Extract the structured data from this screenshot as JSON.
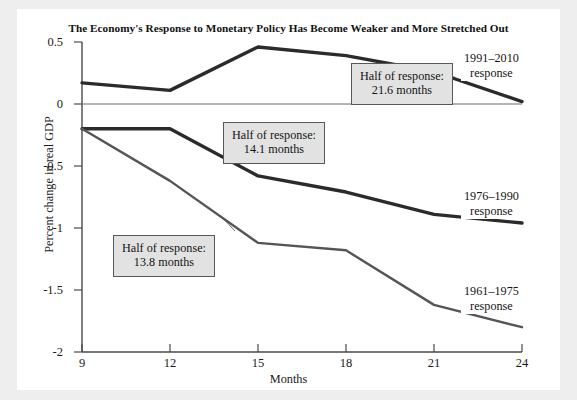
{
  "chart_data": {
    "type": "line",
    "title": "The Economy's Response to Monetary Policy Has Become Weaker and More Stretched Out",
    "xlabel": "Months",
    "ylabel": "Percent change in real GDP",
    "x": [
      9,
      12,
      15,
      18,
      21,
      24
    ],
    "xlim": [
      9,
      24
    ],
    "ylim": [
      -2,
      0.5
    ],
    "xticks": [
      "9",
      "12",
      "15",
      "18",
      "21",
      "24"
    ],
    "yticks": [
      "0.5",
      "0",
      "-0.5",
      "-1",
      "-1.5",
      "-2"
    ],
    "ytick_values": [
      0.5,
      0,
      -0.5,
      -1,
      -1.5,
      -2
    ],
    "grid": false,
    "zero_line": true,
    "legend": "inline-right-labels",
    "series": [
      {
        "name": "1991-2010 response",
        "label_line1": "1991–2010",
        "label_line2": "response",
        "values": [
          0.17,
          0.11,
          0.46,
          0.39,
          0.26,
          0.02
        ],
        "color": "#2b2b2b",
        "width": 3.4
      },
      {
        "name": "1976-1990 response",
        "label_line1": "1976–1990",
        "label_line2": "response",
        "values": [
          -0.2,
          -0.2,
          -0.58,
          -0.71,
          -0.89,
          -0.96
        ],
        "color": "#2b2b2b",
        "width": 3.4
      },
      {
        "name": "1961-1975 response",
        "label_line1": "1961–1975",
        "label_line2": "response",
        "values": [
          -0.2,
          -0.62,
          -1.12,
          -1.18,
          -1.62,
          -1.8
        ],
        "color": "#555555",
        "width": 2.4
      }
    ],
    "annotations": [
      {
        "id": "half-response-21-6",
        "line1": "Half of response:",
        "line2": "21.6 months",
        "target_series": "1991-2010 response"
      },
      {
        "id": "half-response-14-1",
        "line1": "Half of response:",
        "line2": "14.1 months",
        "target_series": "1976-1990 response"
      },
      {
        "id": "half-response-13-8",
        "line1": "Half of response:",
        "line2": "13.8 months",
        "target_series": "1961-1975 response"
      }
    ],
    "colors": {
      "background": "#eeeeee",
      "panel": "#ffffff",
      "axis": "#4a4a4a",
      "callout_fill": "#e2e2e2",
      "callout_border": "#55585c"
    }
  }
}
